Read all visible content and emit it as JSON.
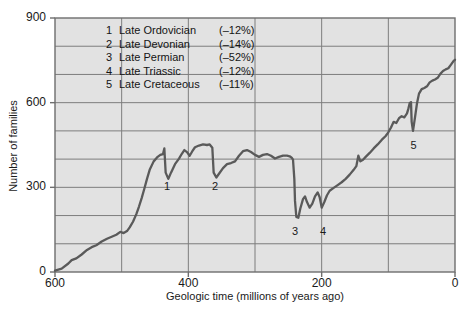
{
  "chart_data": {
    "type": "line",
    "title": "",
    "xlabel": "Geologic time (millions of years ago)",
    "ylabel": "Number of families",
    "xlim": [
      600,
      0
    ],
    "ylim": [
      0,
      900
    ],
    "x_ticks": [
      600,
      400,
      200,
      0
    ],
    "x_minor_ticks": [
      500,
      300,
      100
    ],
    "y_ticks": [
      0,
      300,
      600,
      900
    ],
    "y_minor_ticks": [
      100,
      200,
      400,
      500,
      700,
      800
    ],
    "grid": true,
    "x_reversed": true,
    "legend_position": "upper-left-inside",
    "series": [
      {
        "name": "Number of marine animal families",
        "color": "#5a5a5a",
        "points": [
          [
            600,
            5
          ],
          [
            590,
            12
          ],
          [
            580,
            30
          ],
          [
            575,
            42
          ],
          [
            568,
            48
          ],
          [
            560,
            62
          ],
          [
            552,
            78
          ],
          [
            545,
            88
          ],
          [
            538,
            95
          ],
          [
            530,
            108
          ],
          [
            522,
            118
          ],
          [
            515,
            125
          ],
          [
            508,
            132
          ],
          [
            502,
            142
          ],
          [
            497,
            138
          ],
          [
            492,
            145
          ],
          [
            488,
            158
          ],
          [
            483,
            178
          ],
          [
            478,
            205
          ],
          [
            474,
            232
          ],
          [
            470,
            262
          ],
          [
            466,
            295
          ],
          [
            462,
            330
          ],
          [
            458,
            362
          ],
          [
            452,
            392
          ],
          [
            446,
            408
          ],
          [
            442,
            415
          ],
          [
            438,
            418
          ],
          [
            436,
            438
          ],
          [
            434,
            352
          ],
          [
            430,
            330
          ],
          [
            426,
            352
          ],
          [
            420,
            382
          ],
          [
            414,
            402
          ],
          [
            410,
            418
          ],
          [
            406,
            432
          ],
          [
            402,
            425
          ],
          [
            398,
            412
          ],
          [
            394,
            428
          ],
          [
            390,
            442
          ],
          [
            384,
            448
          ],
          [
            378,
            452
          ],
          [
            372,
            450
          ],
          [
            368,
            452
          ],
          [
            364,
            440
          ],
          [
            362,
            352
          ],
          [
            358,
            335
          ],
          [
            354,
            348
          ],
          [
            348,
            368
          ],
          [
            342,
            382
          ],
          [
            336,
            386
          ],
          [
            330,
            392
          ],
          [
            324,
            412
          ],
          [
            318,
            428
          ],
          [
            312,
            432
          ],
          [
            306,
            425
          ],
          [
            300,
            415
          ],
          [
            294,
            408
          ],
          [
            288,
            415
          ],
          [
            282,
            418
          ],
          [
            276,
            412
          ],
          [
            270,
            402
          ],
          [
            264,
            408
          ],
          [
            258,
            412
          ],
          [
            252,
            412
          ],
          [
            248,
            410
          ],
          [
            245,
            405
          ],
          [
            243,
            398
          ],
          [
            241,
            330
          ],
          [
            240,
            252
          ],
          [
            238,
            195
          ],
          [
            235,
            192
          ],
          [
            232,
            225
          ],
          [
            228,
            258
          ],
          [
            225,
            268
          ],
          [
            222,
            248
          ],
          [
            218,
            228
          ],
          [
            214,
            242
          ],
          [
            210,
            268
          ],
          [
            206,
            282
          ],
          [
            203,
            265
          ],
          [
            200,
            228
          ],
          [
            196,
            248
          ],
          [
            192,
            272
          ],
          [
            188,
            288
          ],
          [
            182,
            298
          ],
          [
            176,
            308
          ],
          [
            170,
            318
          ],
          [
            164,
            330
          ],
          [
            158,
            345
          ],
          [
            152,
            362
          ],
          [
            148,
            375
          ],
          [
            145,
            412
          ],
          [
            142,
            392
          ],
          [
            138,
            398
          ],
          [
            134,
            408
          ],
          [
            128,
            422
          ],
          [
            122,
            438
          ],
          [
            116,
            452
          ],
          [
            110,
            468
          ],
          [
            104,
            482
          ],
          [
            100,
            495
          ],
          [
            96,
            512
          ],
          [
            92,
            532
          ],
          [
            88,
            528
          ],
          [
            84,
            545
          ],
          [
            80,
            552
          ],
          [
            76,
            548
          ],
          [
            72,
            562
          ],
          [
            70,
            578
          ],
          [
            68,
            598
          ],
          [
            66,
            602
          ],
          [
            65,
            532
          ],
          [
            63,
            500
          ],
          [
            60,
            548
          ],
          [
            57,
            598
          ],
          [
            54,
            632
          ],
          [
            50,
            648
          ],
          [
            46,
            652
          ],
          [
            42,
            658
          ],
          [
            38,
            672
          ],
          [
            34,
            678
          ],
          [
            30,
            682
          ],
          [
            26,
            688
          ],
          [
            22,
            702
          ],
          [
            18,
            712
          ],
          [
            14,
            718
          ],
          [
            10,
            722
          ],
          [
            6,
            735
          ],
          [
            2,
            748
          ],
          [
            0,
            752
          ]
        ]
      }
    ],
    "annotations": [
      {
        "label": "1",
        "x": 434,
        "y": 352,
        "text_x": 432,
        "text_y": 300
      },
      {
        "label": "2",
        "x": 362,
        "y": 352,
        "text_x": 360,
        "text_y": 300
      },
      {
        "label": "3",
        "x": 238,
        "y": 195,
        "text_x": 240,
        "text_y": 140
      },
      {
        "label": "4",
        "x": 200,
        "y": 228,
        "text_x": 198,
        "text_y": 140
      },
      {
        "label": "5",
        "x": 63,
        "y": 500,
        "text_x": 62,
        "text_y": 448
      }
    ]
  },
  "legend": {
    "entries": [
      {
        "num": "1",
        "name": "Late Ordovician",
        "pct": "(–12%)"
      },
      {
        "num": "2",
        "name": "Late Devonian",
        "pct": "(–14%)"
      },
      {
        "num": "3",
        "name": "Late Permian",
        "pct": "(–52%)"
      },
      {
        "num": "4",
        "name": "Late Triassic",
        "pct": "(–12%)"
      },
      {
        "num": "5",
        "name": "Late Cretaceous",
        "pct": "(–11%)"
      }
    ]
  },
  "colors": {
    "plot_background": "#e2e2e2",
    "gridline": "#7d7d7d",
    "axis_border": "#6e6e6e",
    "curve": "#5a5a5a",
    "text": "#1a1a1a",
    "page_background": "#ffffff"
  }
}
